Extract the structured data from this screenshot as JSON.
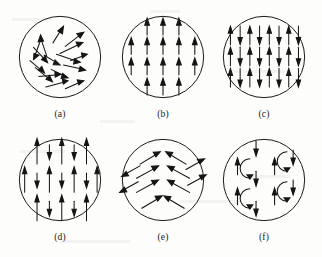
{
  "figure": {
    "background_color": "#fdfdfb",
    "ink_color": "#141414",
    "panel_count": 6,
    "columns": 3,
    "rows": 2
  },
  "panels": [
    {
      "id": "a",
      "caption": "(a)",
      "ordering": "paramagnetic",
      "description": "randomly oriented spins",
      "circle": {
        "cx": 60,
        "cy": 58,
        "r": 46
      },
      "arrow_count": 16,
      "arrows": [
        {
          "x": 38,
          "y": 50,
          "angle": -70,
          "len": 22
        },
        {
          "x": 46,
          "y": 33,
          "angle": -65,
          "len": 20
        },
        {
          "x": 60,
          "y": 30,
          "angle": -55,
          "len": 24
        },
        {
          "x": 72,
          "y": 35,
          "angle": -28,
          "len": 26
        },
        {
          "x": 80,
          "y": 45,
          "angle": -18,
          "len": 22
        },
        {
          "x": 28,
          "y": 52,
          "angle": 40,
          "len": 24
        },
        {
          "x": 34,
          "y": 66,
          "angle": 35,
          "len": 22
        },
        {
          "x": 44,
          "y": 60,
          "angle": 28,
          "len": 20
        },
        {
          "x": 56,
          "y": 52,
          "angle": 18,
          "len": 26
        },
        {
          "x": 70,
          "y": 58,
          "angle": 22,
          "len": 24
        },
        {
          "x": 82,
          "y": 62,
          "angle": 12,
          "len": 20
        },
        {
          "x": 40,
          "y": 80,
          "angle": -12,
          "len": 22
        },
        {
          "x": 56,
          "y": 74,
          "angle": 35,
          "len": 22
        },
        {
          "x": 68,
          "y": 72,
          "angle": -35,
          "len": 20
        },
        {
          "x": 52,
          "y": 88,
          "angle": 22,
          "len": 24
        },
        {
          "x": 76,
          "y": 86,
          "angle": 18,
          "len": 18
        }
      ]
    },
    {
      "id": "b",
      "caption": "(b)",
      "ordering": "ferromagnetic",
      "description": "all spins parallel, pointing up",
      "circle": {
        "cx": 60,
        "cy": 58,
        "r": 46
      },
      "grid_rows": [
        {
          "y": 24,
          "count": 3,
          "x_start": 42,
          "x_step": 18,
          "dirs": [
            "up",
            "up",
            "up"
          ]
        },
        {
          "y": 46,
          "count": 5,
          "x_start": 24,
          "x_step": 18,
          "dirs": [
            "up",
            "up",
            "up",
            "up",
            "up"
          ]
        },
        {
          "y": 68,
          "count": 5,
          "x_start": 24,
          "x_step": 18,
          "dirs": [
            "up",
            "up",
            "up",
            "up",
            "up"
          ]
        },
        {
          "y": 90,
          "count": 3,
          "x_start": 42,
          "x_step": 18,
          "dirs": [
            "up",
            "up",
            "up"
          ]
        }
      ],
      "arrow_length": 18
    },
    {
      "id": "c",
      "caption": "(c)",
      "ordering": "antiferromagnetic",
      "description": "alternating up and down spins of equal magnitude",
      "circle": {
        "cx": 60,
        "cy": 58,
        "r": 46
      },
      "grid_rows": [
        {
          "y": 34,
          "count": 8,
          "x_start": 22,
          "x_step": 11,
          "dirs": [
            "up",
            "down",
            "up",
            "down",
            "up",
            "down",
            "up",
            "down"
          ]
        },
        {
          "y": 58,
          "count": 8,
          "x_start": 22,
          "x_step": 11,
          "dirs": [
            "up",
            "down",
            "up",
            "down",
            "up",
            "down",
            "up",
            "down"
          ]
        },
        {
          "y": 82,
          "count": 8,
          "x_start": 22,
          "x_step": 11,
          "dirs": [
            "up",
            "down",
            "up",
            "down",
            "up",
            "down",
            "up",
            "down"
          ]
        }
      ],
      "arrow_length": 20
    },
    {
      "id": "d",
      "caption": "(d)",
      "ordering": "ferrimagnetic",
      "description": "alternating long up and short down spins of unequal magnitude",
      "circle": {
        "cx": 60,
        "cy": 58,
        "r": 46
      },
      "grid_rows": [
        {
          "y": 26,
          "count": 5,
          "x_start": 34,
          "x_step": 14,
          "dirs": [
            "up",
            "down",
            "up",
            "down",
            "up"
          ]
        },
        {
          "y": 58,
          "count": 7,
          "x_start": 20,
          "x_step": 14,
          "dirs": [
            "up",
            "down",
            "up",
            "down",
            "up",
            "down",
            "up"
          ]
        },
        {
          "y": 90,
          "count": 5,
          "x_start": 34,
          "x_step": 14,
          "dirs": [
            "up",
            "down",
            "up",
            "down",
            "up"
          ]
        }
      ],
      "long_length": 30,
      "short_length": 16
    },
    {
      "id": "e",
      "caption": "(e)",
      "ordering": "canted-antiferromagnetic",
      "description": "canted spins forming chevron pattern, weak ferromagnetism",
      "circle": {
        "cx": 60,
        "cy": 58,
        "r": 46
      },
      "chevron_rows": [
        {
          "y": 30,
          "left_x": 44,
          "right_x": 76,
          "tilt": 30
        },
        {
          "y": 50,
          "left_x": 42,
          "right_x": 78,
          "tilt": 30
        },
        {
          "y": 68,
          "left_x": 42,
          "right_x": 78,
          "tilt": 30
        },
        {
          "y": 86,
          "left_x": 46,
          "right_x": 74,
          "tilt": 30
        }
      ],
      "edge_arrows": [
        {
          "x": 22,
          "y": 44,
          "angle": 210,
          "len": 22
        },
        {
          "x": 22,
          "y": 62,
          "angle": 210,
          "len": 22
        },
        {
          "x": 96,
          "y": 44,
          "angle": 30,
          "len": 22
        },
        {
          "x": 96,
          "y": 62,
          "angle": 30,
          "len": 22
        }
      ],
      "arrow_length": 24
    },
    {
      "id": "f",
      "caption": "(f)",
      "ordering": "helical",
      "description": "helical or spiral spin arrangement with rotating moments",
      "circle": {
        "cx": 60,
        "cy": 58,
        "r": 46
      },
      "vertical_arrows": [
        {
          "x": 30,
          "y": 42,
          "dir": "up",
          "len": 18
        },
        {
          "x": 30,
          "y": 74,
          "dir": "up",
          "len": 18
        },
        {
          "x": 48,
          "y": 22,
          "dir": "down",
          "len": 18
        },
        {
          "x": 48,
          "y": 54,
          "dir": "down",
          "len": 18
        },
        {
          "x": 48,
          "y": 88,
          "dir": "down",
          "len": 18
        },
        {
          "x": 68,
          "y": 42,
          "dir": "up",
          "len": 18
        },
        {
          "x": 68,
          "y": 74,
          "dir": "up",
          "len": 18
        },
        {
          "x": 86,
          "y": 34,
          "dir": "down",
          "len": 18
        },
        {
          "x": 86,
          "y": 66,
          "dir": "down",
          "len": 18
        }
      ],
      "arcs": [
        {
          "cx": 44,
          "cy": 44,
          "r": 10,
          "open": "left"
        },
        {
          "cx": 44,
          "cy": 78,
          "r": 10,
          "open": "left"
        },
        {
          "cx": 82,
          "cy": 36,
          "r": 10,
          "open": "left"
        },
        {
          "cx": 82,
          "cy": 70,
          "r": 10,
          "open": "left"
        }
      ]
    }
  ]
}
